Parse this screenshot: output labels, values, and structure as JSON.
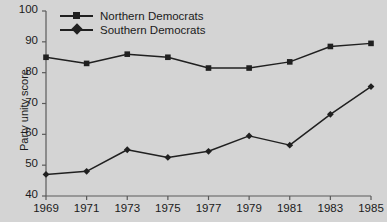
{
  "chart_data": {
    "type": "line",
    "title": "",
    "xlabel": "",
    "ylabel": "Party unity score",
    "categories": [
      "1969",
      "1971",
      "1973",
      "1975",
      "1977",
      "1979",
      "1981",
      "1983",
      "1985"
    ],
    "x": [
      1969,
      1971,
      1973,
      1975,
      1977,
      1979,
      1981,
      1983,
      1985
    ],
    "xlim": [
      1969,
      1985
    ],
    "ylim": [
      40,
      100
    ],
    "yticks": [
      40,
      50,
      60,
      70,
      80,
      90,
      100
    ],
    "ytick_labels": [
      "40",
      "50",
      "60",
      "70",
      "80",
      "90",
      "100"
    ],
    "grid": false,
    "legend_position": "top-left-inside",
    "series": [
      {
        "name": "Northern Democrats",
        "marker": "square",
        "color": "#202020",
        "values": [
          85,
          83,
          86,
          85,
          81.5,
          81.5,
          83.5,
          88.5,
          89.5
        ]
      },
      {
        "name": "Southern Democrats",
        "marker": "diamond",
        "color": "#202020",
        "values": [
          47,
          48,
          55,
          52.5,
          54.5,
          59.5,
          56.5,
          66.5,
          75.5
        ]
      }
    ],
    "background_color": "#d4d4d4",
    "axis_color": "#5a5a5a",
    "text_color": "#1b1b1b"
  }
}
